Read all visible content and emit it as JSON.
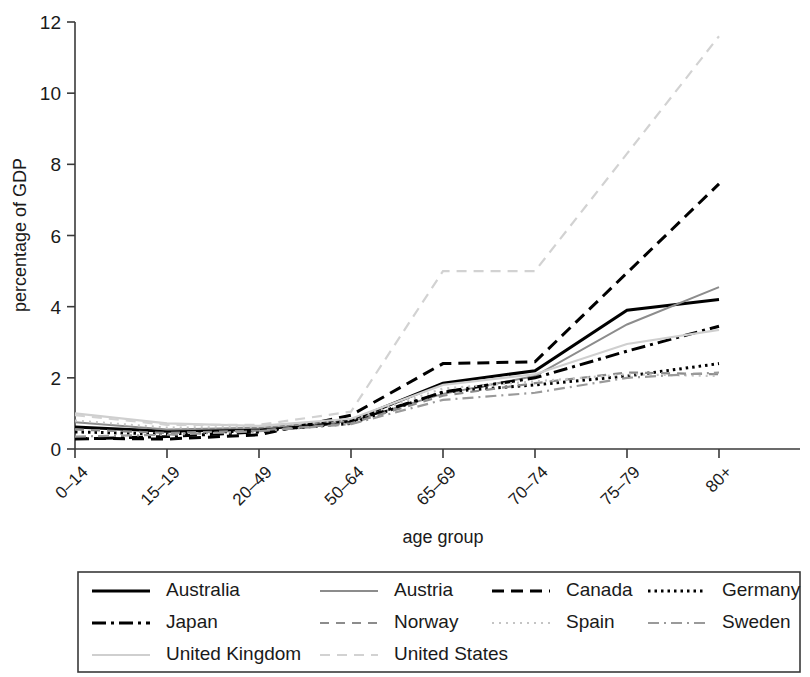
{
  "chart_data": {
    "type": "line",
    "title": "",
    "xlabel": "age group",
    "ylabel": "percentage of GDP",
    "categories": [
      "0–14",
      "15–19",
      "20–49",
      "50–64",
      "65–69",
      "70–74",
      "75–79",
      "80+"
    ],
    "ylim": [
      0,
      12
    ],
    "yticks": [
      0,
      2,
      4,
      6,
      8,
      10,
      12
    ],
    "ytick_labels": [
      "0",
      "2",
      "4",
      "6",
      "8",
      "10",
      "12"
    ],
    "grid": false,
    "legend_position": "bottom",
    "legend_columns": 4,
    "series": [
      {
        "name": "Australia",
        "color": "#000000",
        "dash": "none",
        "width": 3.0,
        "values": [
          0.62,
          0.5,
          0.55,
          0.8,
          1.85,
          2.2,
          3.9,
          4.2
        ]
      },
      {
        "name": "Austria",
        "color": "#8c8c8c",
        "dash": "none",
        "width": 2.0,
        "values": [
          0.75,
          0.55,
          0.6,
          0.78,
          1.55,
          2.05,
          3.5,
          4.55
        ]
      },
      {
        "name": "Canada",
        "color": "#000000",
        "dash": "12,7",
        "width": 3.0,
        "values": [
          0.3,
          0.28,
          0.4,
          0.95,
          2.4,
          2.45,
          4.95,
          7.45
        ]
      },
      {
        "name": "Germany",
        "color": "#000000",
        "dash": "2.5,4",
        "width": 3.0,
        "values": [
          0.48,
          0.42,
          0.52,
          0.72,
          1.6,
          1.8,
          2.05,
          2.4
        ]
      },
      {
        "name": "Japan",
        "color": "#000000",
        "dash": "14,5,3,5",
        "width": 3.0,
        "values": [
          0.28,
          0.35,
          0.48,
          0.78,
          1.6,
          2.0,
          2.75,
          3.45
        ]
      },
      {
        "name": "Norway",
        "color": "#8c8c8c",
        "dash": "9,7",
        "width": 2.2,
        "values": [
          0.55,
          0.45,
          0.52,
          0.72,
          1.5,
          1.85,
          2.15,
          2.1
        ]
      },
      {
        "name": "Spain",
        "color": "#c4c4c4",
        "dash": "2,5",
        "width": 2.2,
        "values": [
          0.8,
          0.6,
          0.62,
          0.82,
          1.7,
          1.9,
          2.1,
          2.05
        ]
      },
      {
        "name": "Sweden",
        "color": "#9a9a9a",
        "dash": "11,5,2,5",
        "width": 2.2,
        "values": [
          0.35,
          0.4,
          0.5,
          0.7,
          1.38,
          1.58,
          2.0,
          2.15
        ]
      },
      {
        "name": "United Kingdom",
        "color": "#cfcfcf",
        "dash": "none",
        "width": 2.2,
        "values": [
          1.0,
          0.72,
          0.65,
          0.85,
          1.8,
          2.1,
          2.95,
          3.35
        ]
      },
      {
        "name": "United States",
        "color": "#d2d2d2",
        "dash": "10,7",
        "width": 2.2,
        "values": [
          0.95,
          0.68,
          0.68,
          1.05,
          5.0,
          5.0,
          8.3,
          11.6
        ]
      }
    ]
  },
  "axes": {
    "y_title": "percentage of GDP",
    "x_title": "age group"
  },
  "legend": {
    "entries": [
      {
        "label": "Australia"
      },
      {
        "label": "Austria"
      },
      {
        "label": "Canada"
      },
      {
        "label": "Germany"
      },
      {
        "label": "Japan"
      },
      {
        "label": "Norway"
      },
      {
        "label": "Spain"
      },
      {
        "label": "Sweden"
      },
      {
        "label": "United Kingdom"
      },
      {
        "label": "United States"
      }
    ]
  }
}
